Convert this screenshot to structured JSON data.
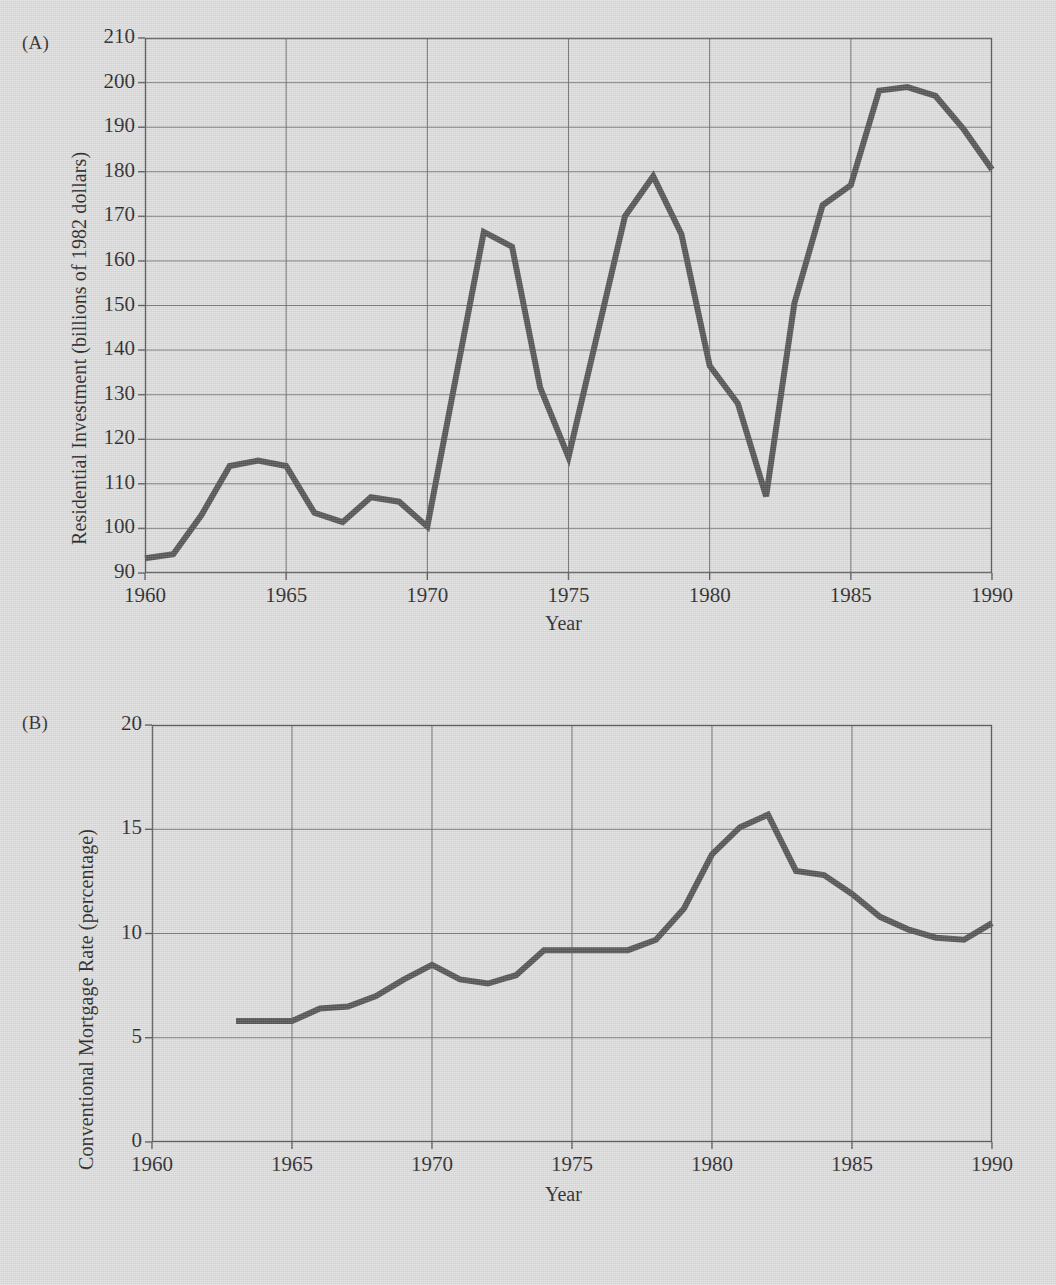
{
  "page": {
    "background_color": "#dcdcdc",
    "ink_color": "#454545",
    "grid_color": "#6f6f6f"
  },
  "panel_a": {
    "tag": "(A)",
    "ylabel": "Residential Investment (billions of 1982 dollars)",
    "xlabel": "Year",
    "y_ticks": [
      "90",
      "100",
      "110",
      "120",
      "130",
      "140",
      "150",
      "160",
      "170",
      "180",
      "190",
      "200",
      "210"
    ],
    "x_ticks": [
      "1960",
      "1965",
      "1970",
      "1975",
      "1980",
      "1985",
      "1990"
    ]
  },
  "panel_b": {
    "tag": "(B)",
    "ylabel": "Conventional Mortgage Rate (percentage)",
    "xlabel": "Year",
    "y_ticks": [
      "0",
      "5",
      "10",
      "15",
      "20"
    ],
    "x_ticks": [
      "1960",
      "1965",
      "1970",
      "1975",
      "1980",
      "1985",
      "1990"
    ]
  },
  "chart_data": [
    {
      "type": "line",
      "panel": "(A)",
      "title": "Residential Investment",
      "xlabel": "Year",
      "ylabel": "Residential Investment (billions of 1982 dollars)",
      "xlim": [
        1960,
        1990
      ],
      "ylim": [
        90,
        210
      ],
      "xticks": [
        1960,
        1965,
        1970,
        1975,
        1980,
        1985,
        1990
      ],
      "yticks": [
        90,
        100,
        110,
        120,
        130,
        140,
        150,
        160,
        170,
        180,
        190,
        200,
        210
      ],
      "grid": true,
      "legend": "none",
      "x": [
        1960,
        1961,
        1962,
        1963,
        1964,
        1965,
        1966,
        1967,
        1968,
        1969,
        1970,
        1971,
        1972,
        1973,
        1974,
        1975,
        1976,
        1977,
        1978,
        1979,
        1980,
        1981,
        1982,
        1983,
        1984,
        1985,
        1986,
        1987,
        1988,
        1989,
        1990
      ],
      "values": [
        93.3,
        94.2,
        103.0,
        114.0,
        115.2,
        114.0,
        103.5,
        101.4,
        107.0,
        106.0,
        100.4,
        133.5,
        166.5,
        163.2,
        131.5,
        116.0,
        143.0,
        170.0,
        179.0,
        166.0,
        136.5,
        128.0,
        107.2,
        150.5,
        172.5,
        177.0,
        198.2,
        199.0,
        197.0,
        189.5,
        180.5
      ]
    },
    {
      "type": "line",
      "panel": "(B)",
      "title": "Conventional Mortgage Rate",
      "xlabel": "Year",
      "ylabel": "Conventional Mortgage Rate (percentage)",
      "xlim": [
        1960,
        1990
      ],
      "ylim": [
        0,
        20
      ],
      "xticks": [
        1960,
        1965,
        1970,
        1975,
        1980,
        1985,
        1990
      ],
      "yticks": [
        0,
        5,
        10,
        15,
        20
      ],
      "grid": true,
      "legend": "none",
      "x": [
        1963,
        1964,
        1965,
        1966,
        1967,
        1968,
        1969,
        1970,
        1971,
        1972,
        1973,
        1974,
        1975,
        1976,
        1977,
        1978,
        1979,
        1980,
        1981,
        1982,
        1983,
        1984,
        1985,
        1986,
        1987,
        1988,
        1989,
        1990
      ],
      "values": [
        5.8,
        5.8,
        5.8,
        6.4,
        6.5,
        7.0,
        7.8,
        8.5,
        7.8,
        7.6,
        8.0,
        9.2,
        9.2,
        9.2,
        9.2,
        9.7,
        11.2,
        13.8,
        15.1,
        15.7,
        13.0,
        12.8,
        11.9,
        10.8,
        10.2,
        9.8,
        9.7,
        10.5,
        10.5
      ]
    }
  ]
}
